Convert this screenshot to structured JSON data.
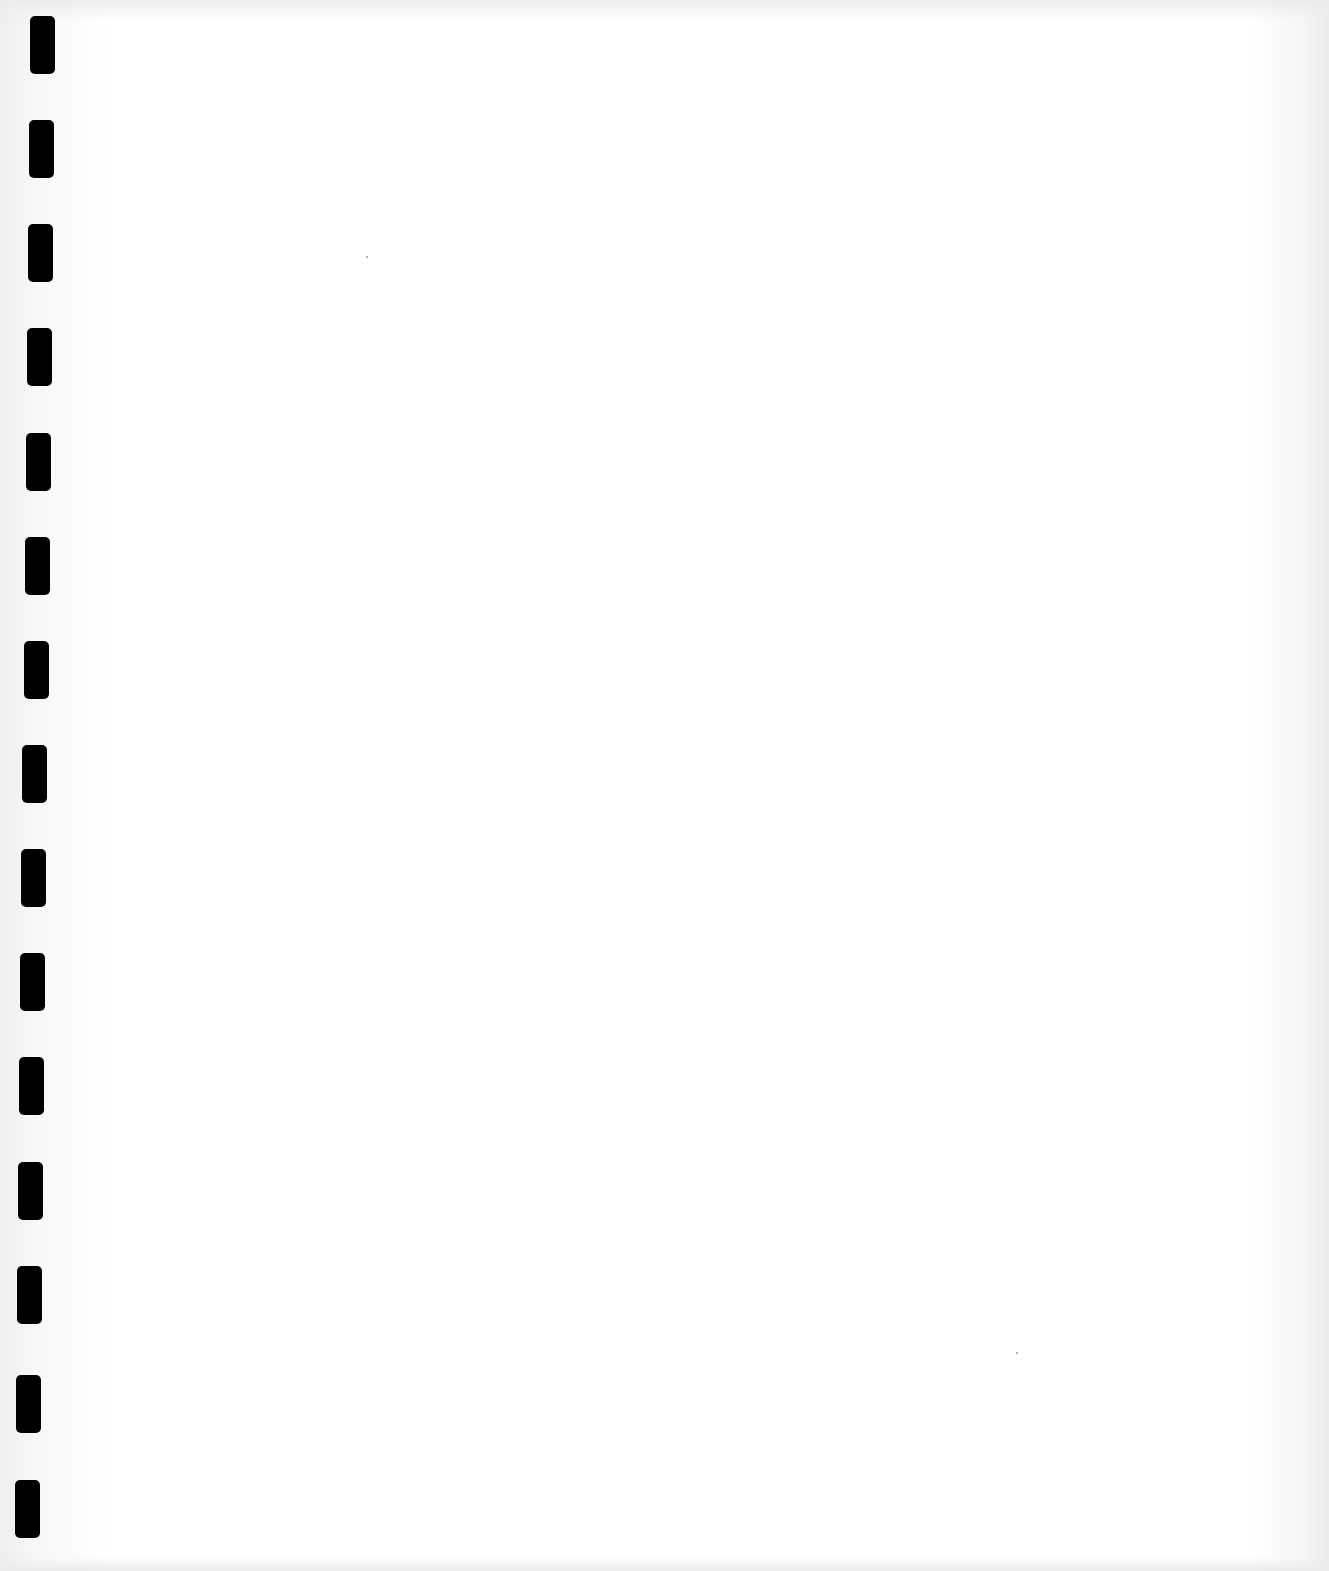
{
  "page": {
    "type": "blank-scanned-sheet",
    "background_color": "#ffffff",
    "binding_holes": {
      "count": 15,
      "color": "#000000",
      "width": 25,
      "height": 58,
      "positions": [
        {
          "x": 30,
          "y": 16
        },
        {
          "x": 29,
          "y": 120
        },
        {
          "x": 28,
          "y": 224
        },
        {
          "x": 27,
          "y": 328
        },
        {
          "x": 26,
          "y": 433
        },
        {
          "x": 25,
          "y": 537
        },
        {
          "x": 24,
          "y": 641
        },
        {
          "x": 22,
          "y": 745
        },
        {
          "x": 21,
          "y": 849
        },
        {
          "x": 20,
          "y": 953
        },
        {
          "x": 19,
          "y": 1057
        },
        {
          "x": 18,
          "y": 1162
        },
        {
          "x": 17,
          "y": 1266
        },
        {
          "x": 16,
          "y": 1375
        },
        {
          "x": 15,
          "y": 1480
        }
      ]
    },
    "specks": [
      {
        "x": 366,
        "y": 256
      },
      {
        "x": 1016,
        "y": 1352
      }
    ]
  }
}
